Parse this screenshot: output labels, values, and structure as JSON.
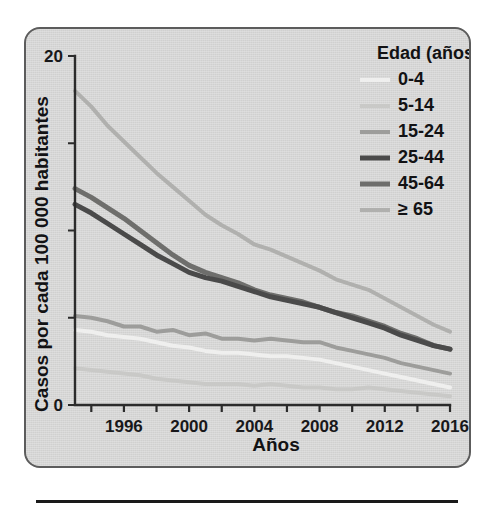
{
  "figure": {
    "panel_background": "#d6d6d4",
    "panel_border_color": "#5c5c5c",
    "rule_color": "#1a1a1a"
  },
  "axes": {
    "y_title": "Casos por cada 100 000 habitantes",
    "x_title": "Años",
    "y_tick_labels": [
      "0",
      "20"
    ],
    "y_label_min": "0",
    "y_label_max": "20",
    "x_tick_labels": [
      "1996",
      "2000",
      "2004",
      "2008",
      "2012",
      "2016"
    ]
  },
  "legend": {
    "title": "Edad (años)",
    "entries": [
      {
        "label": "0-4",
        "color": "#efefee"
      },
      {
        "label": "5-14",
        "color": "#c9c9c7"
      },
      {
        "label": "15-24",
        "color": "#9d9d9b"
      },
      {
        "label": "25-44",
        "color": "#4a4a4a"
      },
      {
        "label": "45-64",
        "color": "#6e6e6c"
      },
      {
        "label": "≥ 65",
        "color": "#b0b0ae"
      }
    ]
  },
  "chart_data": {
    "type": "line",
    "title": "",
    "xlabel": "Años",
    "ylabel": "Casos por cada 100 000 habitantes",
    "xlim": [
      1993,
      2016
    ],
    "ylim": [
      0,
      20
    ],
    "y_ticks": [
      0,
      5,
      10,
      15,
      20
    ],
    "y_tick_labels_shown": [
      0,
      20
    ],
    "x_ticks": [
      1994,
      1996,
      1998,
      2000,
      2002,
      2004,
      2006,
      2008,
      2010,
      2012,
      2014,
      2016
    ],
    "x_tick_labels_shown": [
      1996,
      2000,
      2004,
      2008,
      2012,
      2016
    ],
    "grid": false,
    "legend_position": "top-right",
    "legend_title": "Edad (años)",
    "x": [
      1993,
      1994,
      1995,
      1996,
      1997,
      1998,
      1999,
      2000,
      2001,
      2002,
      2003,
      2004,
      2005,
      2006,
      2007,
      2008,
      2009,
      2010,
      2011,
      2012,
      2013,
      2014,
      2015,
      2016
    ],
    "series": [
      {
        "name": "0-4",
        "color": "#efefee",
        "values": [
          4.3,
          4.2,
          4.0,
          3.9,
          3.8,
          3.6,
          3.4,
          3.3,
          3.1,
          3.0,
          3.0,
          2.9,
          2.8,
          2.8,
          2.7,
          2.6,
          2.4,
          2.2,
          2.0,
          1.8,
          1.6,
          1.4,
          1.2,
          1.0
        ]
      },
      {
        "name": "5-14",
        "color": "#c9c9c7",
        "values": [
          2.1,
          2.0,
          1.9,
          1.8,
          1.7,
          1.5,
          1.4,
          1.3,
          1.2,
          1.2,
          1.2,
          1.1,
          1.2,
          1.1,
          1.0,
          1.0,
          0.9,
          0.9,
          1.0,
          0.9,
          0.8,
          0.7,
          0.6,
          0.5
        ]
      },
      {
        "name": "15-24",
        "color": "#9d9d9b",
        "values": [
          5.1,
          5.0,
          4.8,
          4.5,
          4.5,
          4.2,
          4.3,
          4.0,
          4.1,
          3.8,
          3.8,
          3.7,
          3.8,
          3.7,
          3.6,
          3.6,
          3.3,
          3.1,
          2.9,
          2.7,
          2.4,
          2.2,
          2.0,
          1.8
        ]
      },
      {
        "name": "25-44",
        "color": "#4a4a4a",
        "values": [
          11.5,
          11.0,
          10.4,
          9.8,
          9.2,
          8.6,
          8.1,
          7.6,
          7.3,
          7.1,
          6.8,
          6.5,
          6.2,
          6.0,
          5.8,
          5.6,
          5.3,
          5.0,
          4.7,
          4.4,
          4.0,
          3.7,
          3.4,
          3.2
        ]
      },
      {
        "name": "45-64",
        "color": "#6e6e6c",
        "values": [
          12.4,
          11.9,
          11.3,
          10.7,
          10.0,
          9.3,
          8.6,
          8.0,
          7.6,
          7.3,
          7.0,
          6.6,
          6.3,
          6.1,
          5.9,
          5.6,
          5.3,
          5.1,
          4.8,
          4.5,
          4.1,
          3.8,
          3.4,
          3.2
        ]
      },
      {
        "name": "≥ 65",
        "color": "#b0b0ae",
        "values": [
          18.0,
          17.1,
          16.0,
          15.1,
          14.2,
          13.3,
          12.5,
          11.7,
          10.9,
          10.3,
          9.8,
          9.2,
          8.9,
          8.5,
          8.1,
          7.7,
          7.2,
          6.9,
          6.6,
          6.1,
          5.6,
          5.1,
          4.6,
          4.2
        ]
      }
    ]
  }
}
